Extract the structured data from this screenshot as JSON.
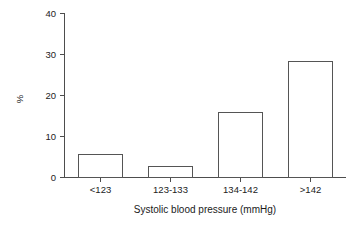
{
  "chart_data": {
    "type": "bar",
    "title": "",
    "subtitle": "",
    "categories": [
      "<123",
      "123-133",
      "134-142",
      ">142"
    ],
    "values": [
      5.6,
      2.7,
      15.9,
      28.4
    ],
    "xlabel": "Systolic blood pressure (mmHg)",
    "ylabel": "%",
    "ylim": [
      0,
      40
    ],
    "yticks": [
      0,
      10,
      20,
      30,
      40
    ],
    "ytick_labels": [
      "0",
      "10",
      "20",
      "30",
      "40"
    ],
    "grid": false,
    "legend": false,
    "legend_position": "none",
    "bar_fill_color": "#ffffff",
    "bar_edge_color": "#555555",
    "axis_color": "#4d4d4d",
    "background_color": "#ffffff",
    "annotations": []
  },
  "axes": {
    "y_title": "%",
    "x_title": "Systolic blood pressure (mmHg)"
  },
  "ticks": {
    "y": [
      {
        "value": 40,
        "label": "40"
      },
      {
        "value": 30,
        "label": "30"
      },
      {
        "value": 20,
        "label": "20"
      },
      {
        "value": 10,
        "label": "10"
      },
      {
        "value": 0,
        "label": "0"
      }
    ],
    "x": [
      {
        "label": "<123"
      },
      {
        "label": "123-133"
      },
      {
        "label": "134-142"
      },
      {
        "label": ">142"
      }
    ]
  }
}
